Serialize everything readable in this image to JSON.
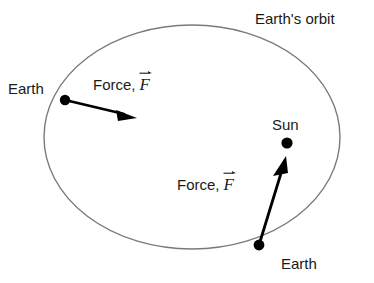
{
  "diagram": {
    "colors": {
      "orbit_stroke": "#7a7a7a",
      "arrow": "#000000",
      "body_dot": "#000000",
      "text": "#1a1a1a",
      "background": "#ffffff"
    },
    "orbit": {
      "label": "Earth's orbit",
      "shape": "ellipse",
      "center_x": 192,
      "center_y": 137,
      "radius_x": 148,
      "radius_y": 112,
      "stroke_width": 1.4
    },
    "bodies": [
      {
        "name": "earth-left",
        "label": "Earth",
        "x": 65,
        "y": 100,
        "radius": 5.2
      },
      {
        "name": "sun",
        "label": "Sun",
        "x": 287,
        "y": 143,
        "radius": 5.6
      },
      {
        "name": "earth-bottom",
        "label": "Earth",
        "x": 259,
        "y": 245,
        "radius": 5.4
      }
    ],
    "force_vectors": [
      {
        "name": "force-vector-upper",
        "label_text": "Force,",
        "symbol": "F",
        "from_x": 65,
        "from_y": 100,
        "to_x": 133,
        "to_y": 117
      },
      {
        "name": "force-vector-lower",
        "label_text": "Force,",
        "symbol": "F",
        "from_x": 259,
        "from_y": 245,
        "to_x": 285,
        "to_y": 158
      }
    ]
  }
}
